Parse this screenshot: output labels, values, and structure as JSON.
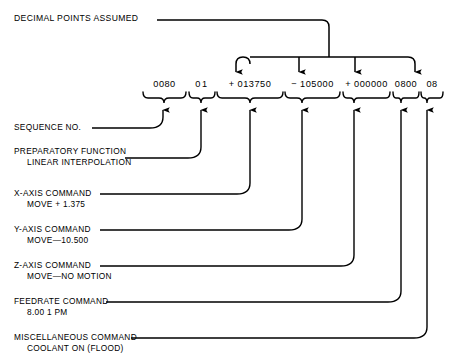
{
  "diagram": {
    "top_annotation": {
      "label": "DECIMAL POINTS ASSUMED"
    },
    "fields": [
      {
        "name": "sequence-number",
        "value": "0080",
        "x": 164,
        "brace_start": 143,
        "brace_end": 186
      },
      {
        "name": "preparatory-function",
        "value": "01",
        "x": 201,
        "brace_start": 189,
        "brace_end": 215
      },
      {
        "name": "x-axis-command",
        "value": "+ 013750",
        "x": 250,
        "brace_start": 217,
        "brace_end": 283
      },
      {
        "name": "y-axis-command",
        "value": "− 105000",
        "x": 302,
        "brace_start": 285,
        "brace_end": 340
      },
      {
        "name": "z-axis-command",
        "value": "+ 000000",
        "x": 354,
        "brace_start": 343,
        "brace_end": 390
      },
      {
        "name": "feedrate-command",
        "value": "0800",
        "x": 401,
        "brace_start": 393,
        "brace_end": 419
      },
      {
        "name": "miscellaneous-command",
        "value": "08",
        "x": 427,
        "brace_start": 421,
        "brace_end": 443
      }
    ],
    "callouts": [
      {
        "name": "sequence-number",
        "line1": "SEQUENCE NO.",
        "line2": ""
      },
      {
        "name": "preparatory-function",
        "line1": "PREPARATORY FUNCTION",
        "line2": "LINEAR INTERPOLATION"
      },
      {
        "name": "x-axis-command",
        "line1": "X-AXIS COMMAND",
        "line2": "MOVE + 1.375"
      },
      {
        "name": "y-axis-command",
        "line1": "Y-AXIS COMMAND",
        "line2": "MOVE—10.500"
      },
      {
        "name": "z-axis-command",
        "line1": "Z-AXIS COMMAND",
        "line2": "MOVE—NO MOTION"
      },
      {
        "name": "feedrate-command",
        "line1": "FEEDRATE COMMAND",
        "line2": "8.00 1 PM"
      },
      {
        "name": "miscellaneous-command",
        "line1": "MISCELLANEOUS COMMAND",
        "line2": "COOLANT ON (FLOOD)"
      }
    ],
    "decimal_arrow_targets": [
      243,
      299,
      355,
      408
    ],
    "colors": {
      "ink": "#000000",
      "background": "#ffffff"
    }
  }
}
